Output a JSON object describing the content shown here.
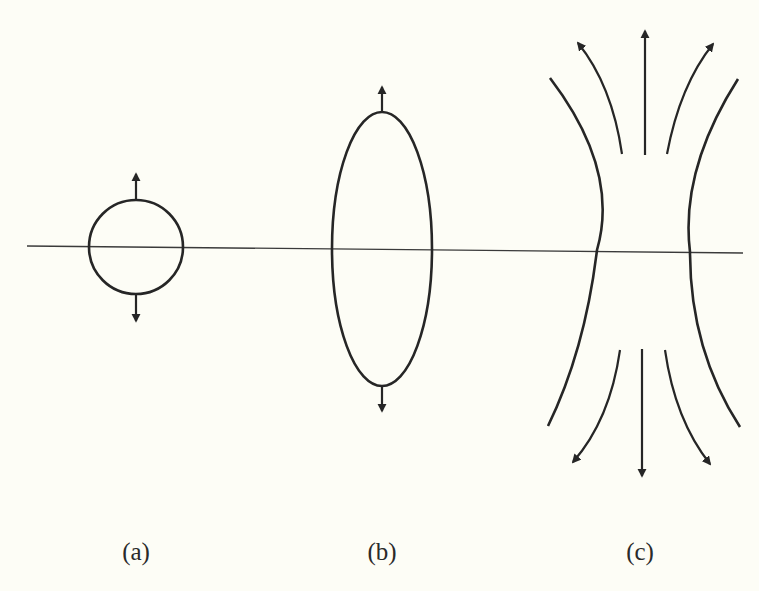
{
  "figure": {
    "background": "#fdfdf6",
    "ink_color": "#262626",
    "axis": {
      "x1": 27,
      "y1": 246,
      "x2": 743,
      "y2": 253
    },
    "panels": [
      {
        "id": "a",
        "label": "(a)",
        "label_x": 136,
        "label_y": 538,
        "shape": "circle",
        "cx": 136,
        "cy": 247,
        "rx": 47,
        "ry": 47,
        "arrow_up": {
          "from": 200,
          "to": 174
        },
        "arrow_down": {
          "from": 295,
          "to": 321
        }
      },
      {
        "id": "b",
        "label": "(b)",
        "label_x": 382,
        "label_y": 538,
        "shape": "ellipse",
        "cx": 382,
        "cy": 249,
        "rx": 50,
        "ry": 137,
        "arrow_up": {
          "from": 112,
          "to": 87
        },
        "arrow_down": {
          "from": 386,
          "to": 411
        }
      },
      {
        "id": "c",
        "label": "(c)",
        "label_x": 640,
        "label_y": 538,
        "shape": "field-lines",
        "outer_curves": [
          "M 550 78 Q 620 170 597 250 Q 585 350 548 426",
          "M 738 79 Q 680 170 690 252 Q 690 350 740 427"
        ],
        "top_arrows": [
          "M 622 154 Q 612 85 578 43",
          "M 645 155 L 645 31",
          "M 667 154 Q 680 85 713 44"
        ],
        "bottom_arrows": [
          "M 620 350 Q 610 420 573 462",
          "M 642 349 L 642 476",
          "M 665 350 Q 675 420 710 464"
        ]
      }
    ]
  }
}
